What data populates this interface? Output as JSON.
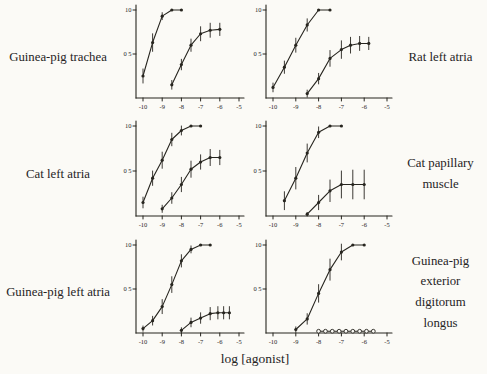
{
  "figure": {
    "xlabel": "log [agonist]",
    "ink_color": "#27251f",
    "paper_color": "#fbfaf6"
  },
  "panels": [
    {
      "id": "guinea-pig-trachea",
      "side": "left",
      "label": "Guinea-pig trachea"
    },
    {
      "id": "rat-left-atria",
      "side": "right",
      "label": "Rat left atria"
    },
    {
      "id": "cat-left-atria",
      "side": "left",
      "label": "Cat left atria"
    },
    {
      "id": "cat-papillary-muscle",
      "side": "right",
      "label": "Cat papillary muscle"
    },
    {
      "id": "guinea-pig-left-atria",
      "side": "left",
      "label": "Guinea-pig left atria"
    },
    {
      "id": "guinea-pig-exterior-digitorum-longus",
      "side": "right",
      "label": "Guinea-pig exterior digitorum longus"
    }
  ],
  "chart_data": [
    {
      "type": "line",
      "title": "Guinea-pig trachea",
      "xlabel": "log [agonist]",
      "ylabel": "",
      "xlim": [
        -10.5,
        -4.7
      ],
      "ylim": [
        0,
        1.05
      ],
      "grid": false,
      "legend": "none",
      "xticks": [
        -10,
        -9,
        -8,
        -7,
        -6,
        -5
      ],
      "yticks": [
        {
          "value": 0.5,
          "label": "0 5"
        },
        {
          "value": 1.0,
          "label": "10"
        }
      ],
      "series": [
        {
          "name": "curve-1",
          "marker": "filled-dot",
          "x": [
            -10,
            -9.5,
            -9,
            -8.5,
            -8
          ],
          "y": [
            0.25,
            0.63,
            0.93,
            1.0,
            1.0
          ],
          "err": [
            0.08,
            0.1,
            0.04,
            0,
            0
          ]
        },
        {
          "name": "curve-2",
          "marker": "filled-dot",
          "x": [
            -8.5,
            -8,
            -7.5,
            -7,
            -6.5,
            -6
          ],
          "y": [
            0.15,
            0.38,
            0.6,
            0.73,
            0.77,
            0.78
          ],
          "err": [
            0.05,
            0.06,
            0.07,
            0.08,
            0.08,
            0.07
          ]
        }
      ]
    },
    {
      "type": "line",
      "title": "Rat left atria",
      "xlabel": "log [agonist]",
      "ylabel": "",
      "xlim": [
        -10.5,
        -4.7
      ],
      "ylim": [
        0,
        1.05
      ],
      "grid": false,
      "legend": "none",
      "xticks": [
        -10,
        -9,
        -8,
        -7,
        -6,
        -5
      ],
      "yticks": [
        {
          "value": 0.5,
          "label": "0 5"
        },
        {
          "value": 1.0,
          "label": "10"
        }
      ],
      "series": [
        {
          "name": "curve-1",
          "marker": "filled-dot",
          "x": [
            -10,
            -9.5,
            -9,
            -8.5,
            -8,
            -7.5
          ],
          "y": [
            0.12,
            0.35,
            0.6,
            0.83,
            1.0,
            1.0
          ],
          "err": [
            0.05,
            0.07,
            0.08,
            0.07,
            0,
            0
          ]
        },
        {
          "name": "curve-2",
          "marker": "filled-dot",
          "x": [
            -8.5,
            -8,
            -7.5,
            -7,
            -6.6,
            -6.2,
            -5.8
          ],
          "y": [
            0.05,
            0.22,
            0.45,
            0.55,
            0.6,
            0.62,
            0.62
          ],
          "err": [
            0.04,
            0.06,
            0.09,
            0.1,
            0.09,
            0.08,
            0.07
          ]
        }
      ]
    },
    {
      "type": "line",
      "title": "Cat left atria",
      "xlabel": "log [agonist]",
      "ylabel": "",
      "xlim": [
        -10.5,
        -4.7
      ],
      "ylim": [
        0,
        1.05
      ],
      "grid": false,
      "legend": "none",
      "xticks": [
        -10,
        -9,
        -8,
        -7,
        -6,
        -5
      ],
      "yticks": [
        {
          "value": 0.5,
          "label": "0 5"
        },
        {
          "value": 1.0,
          "label": "10"
        }
      ],
      "series": [
        {
          "name": "curve-1",
          "marker": "filled-dot",
          "x": [
            -10,
            -9.5,
            -9,
            -8.5,
            -8,
            -7.5,
            -7
          ],
          "y": [
            0.15,
            0.42,
            0.62,
            0.85,
            0.95,
            1.0,
            1.0
          ],
          "err": [
            0.06,
            0.08,
            0.09,
            0.07,
            0.05,
            0,
            0
          ]
        },
        {
          "name": "curve-2",
          "marker": "filled-dot",
          "x": [
            -9,
            -8.5,
            -8,
            -7.5,
            -7,
            -6.5,
            -6
          ],
          "y": [
            0.08,
            0.2,
            0.35,
            0.52,
            0.6,
            0.65,
            0.65
          ],
          "err": [
            0.04,
            0.06,
            0.08,
            0.09,
            0.08,
            0.09,
            0.08
          ]
        }
      ]
    },
    {
      "type": "line",
      "title": "Cat papillary muscle",
      "xlabel": "log [agonist]",
      "ylabel": "",
      "xlim": [
        -10.5,
        -4.7
      ],
      "ylim": [
        0,
        1.05
      ],
      "grid": false,
      "legend": "none",
      "xticks": [
        -10,
        -9,
        -8,
        -7,
        -6,
        -5
      ],
      "yticks": [
        {
          "value": 0.5,
          "label": "0 5"
        },
        {
          "value": 1.0,
          "label": "10"
        }
      ],
      "series": [
        {
          "name": "curve-1",
          "marker": "filled-dot",
          "x": [
            -9.5,
            -9,
            -8.5,
            -8,
            -7.5,
            -7
          ],
          "y": [
            0.17,
            0.42,
            0.7,
            0.93,
            1.0,
            1.0
          ],
          "err": [
            0.1,
            0.12,
            0.1,
            0.06,
            0,
            0
          ]
        },
        {
          "name": "curve-2",
          "marker": "filled-dot",
          "x": [
            -8.5,
            -8,
            -7.5,
            -7,
            -6.5,
            -6
          ],
          "y": [
            0.02,
            0.15,
            0.28,
            0.35,
            0.35,
            0.35
          ],
          "err": [
            0.02,
            0.08,
            0.12,
            0.15,
            0.16,
            0.16
          ]
        }
      ]
    },
    {
      "type": "line",
      "title": "Guinea-pig left atria",
      "xlabel": "log [agonist]",
      "ylabel": "",
      "xlim": [
        -10.5,
        -4.7
      ],
      "ylim": [
        0,
        1.05
      ],
      "grid": false,
      "legend": "none",
      "xticks": [
        -10,
        -9,
        -8,
        -7,
        -6,
        -5
      ],
      "yticks": [
        {
          "value": 0.5,
          "label": "0 5"
        },
        {
          "value": 1.0,
          "label": "10"
        }
      ],
      "series": [
        {
          "name": "curve-1",
          "marker": "filled-dot",
          "x": [
            -10,
            -9.5,
            -9,
            -8.5,
            -8,
            -7.5,
            -7,
            -6.5
          ],
          "y": [
            0.05,
            0.14,
            0.3,
            0.55,
            0.82,
            0.95,
            1.0,
            1.0
          ],
          "err": [
            0.03,
            0.05,
            0.08,
            0.09,
            0.07,
            0.04,
            0,
            0
          ]
        },
        {
          "name": "curve-2",
          "marker": "filled-dot",
          "x": [
            -8,
            -7.5,
            -7,
            -6.5,
            -6.1,
            -5.8,
            -5.5
          ],
          "y": [
            0.03,
            0.12,
            0.17,
            0.22,
            0.23,
            0.23,
            0.23
          ],
          "err": [
            0.03,
            0.05,
            0.06,
            0.07,
            0.07,
            0.07,
            0.07
          ]
        }
      ]
    },
    {
      "type": "line",
      "title": "Guinea-pig exterior digitorum longus",
      "xlabel": "log [agonist]",
      "ylabel": "",
      "xlim": [
        -10.5,
        -4.7
      ],
      "ylim": [
        0,
        1.05
      ],
      "grid": false,
      "legend": "none",
      "xticks": [
        -10,
        -9,
        -8,
        -7,
        -6,
        -5
      ],
      "yticks": [
        {
          "value": 0.5,
          "label": "0 5"
        },
        {
          "value": 1.0,
          "label": "10"
        }
      ],
      "series": [
        {
          "name": "curve-1",
          "marker": "filled-dot",
          "x": [
            -9,
            -8.5,
            -8,
            -7.5,
            -7,
            -6.5,
            -6
          ],
          "y": [
            0.04,
            0.16,
            0.45,
            0.72,
            0.92,
            1.0,
            1.0
          ],
          "err": [
            0.03,
            0.06,
            0.1,
            0.12,
            0.09,
            0,
            0
          ]
        },
        {
          "name": "curve-2",
          "marker": "open-circle",
          "x": [
            -8,
            -7.7,
            -7.4,
            -7.1,
            -6.8,
            -6.5,
            -6.2,
            -5.9,
            -5.6
          ],
          "y": [
            0.02,
            0.02,
            0.02,
            0.02,
            0.02,
            0.02,
            0.02,
            0.02,
            0.02
          ],
          "err": [
            0,
            0,
            0,
            0,
            0,
            0,
            0,
            0,
            0
          ]
        }
      ]
    }
  ]
}
